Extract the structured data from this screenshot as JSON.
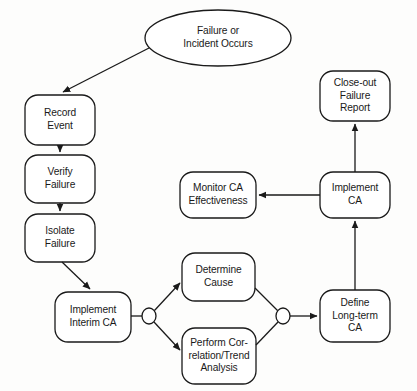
{
  "diagram": {
    "type": "flowchart",
    "stroke_color": "#1a1a1a",
    "fill_color": "#ffffff",
    "background_color": "#fdfdfc",
    "nodes": [
      {
        "id": "failure-or-incident-occurs",
        "label": "Failure or\nIncident Occurs",
        "shape": "ellipse",
        "x": 145,
        "y": 10,
        "w": 146,
        "h": 56
      },
      {
        "id": "record-event",
        "label": "Record\nEvent",
        "shape": "rounded-rect",
        "x": 25,
        "y": 95,
        "w": 70,
        "h": 50
      },
      {
        "id": "verify-failure",
        "label": "Verify\nFailure",
        "shape": "rounded-rect",
        "x": 25,
        "y": 155,
        "w": 70,
        "h": 48
      },
      {
        "id": "isolate-failure",
        "label": "Isolate\nFailure",
        "shape": "rounded-rect",
        "x": 25,
        "y": 214,
        "w": 70,
        "h": 48
      },
      {
        "id": "implement-interim-ca",
        "label": "Implement\nInterim CA",
        "shape": "rounded-rect",
        "x": 55,
        "y": 292,
        "w": 76,
        "h": 50
      },
      {
        "id": "determine-cause",
        "label": "Determine\nCause",
        "shape": "rounded-rect",
        "x": 182,
        "y": 253,
        "w": 73,
        "h": 48
      },
      {
        "id": "perform-correlation-trend-analysis",
        "label": "Perform Cor-\nrelation/Trend\nAnalysis",
        "shape": "rounded-rect",
        "x": 182,
        "y": 328,
        "w": 74,
        "h": 56
      },
      {
        "id": "define-long-term-ca",
        "label": "Define\nLong-term\nCA",
        "shape": "rounded-rect",
        "x": 320,
        "y": 290,
        "w": 70,
        "h": 52,
        "first_line_bold": true
      },
      {
        "id": "monitor-ca-effectiveness",
        "label": "Monitor CA\nEffectiveness",
        "shape": "rounded-rect",
        "x": 180,
        "y": 172,
        "w": 76,
        "h": 46
      },
      {
        "id": "implement-ca",
        "label": "Implement\nCA",
        "shape": "rounded-rect",
        "x": 320,
        "y": 172,
        "w": 70,
        "h": 46
      },
      {
        "id": "close-out-failure-report",
        "label": "Close-out\nFailure\nReport",
        "shape": "rounded-rect",
        "x": 320,
        "y": 71,
        "w": 70,
        "h": 50
      }
    ],
    "junctions": [
      {
        "id": "split-junction",
        "cx": 149,
        "cy": 316,
        "rx": 7,
        "ry": 8
      },
      {
        "id": "merge-junction",
        "cx": 283,
        "cy": 316,
        "rx": 7,
        "ry": 8
      }
    ],
    "connectors": [
      {
        "id": "occurs-to-record-event",
        "from": "failure-or-incident-occurs",
        "to": "record-event",
        "arrow": true
      },
      {
        "id": "record-event-to-verify-failure",
        "from": "record-event",
        "to": "verify-failure",
        "arrow": true
      },
      {
        "id": "verify-failure-to-isolate-failure",
        "from": "verify-failure",
        "to": "isolate-failure",
        "arrow": true
      },
      {
        "id": "isolate-failure-to-implement-interim-ca",
        "from": "isolate-failure",
        "to": "implement-interim-ca",
        "arrow": true
      },
      {
        "id": "implement-interim-ca-to-split",
        "from": "implement-interim-ca",
        "to": "split-junction",
        "arrow": false
      },
      {
        "id": "split-to-determine-cause",
        "from": "split-junction",
        "to": "determine-cause",
        "arrow": true
      },
      {
        "id": "split-to-perform-correlation",
        "from": "split-junction",
        "to": "perform-correlation-trend-analysis",
        "arrow": true
      },
      {
        "id": "determine-cause-to-merge",
        "from": "determine-cause",
        "to": "merge-junction",
        "arrow": false
      },
      {
        "id": "perform-correlation-to-merge",
        "from": "perform-correlation-trend-analysis",
        "to": "merge-junction",
        "arrow": false
      },
      {
        "id": "merge-to-define-long-term-ca",
        "from": "merge-junction",
        "to": "define-long-term-ca",
        "arrow": true
      },
      {
        "id": "define-long-term-ca-to-implement-ca",
        "from": "define-long-term-ca",
        "to": "implement-ca",
        "arrow": true
      },
      {
        "id": "implement-ca-to-monitor-ca-effectiveness",
        "from": "implement-ca",
        "to": "monitor-ca-effectiveness",
        "arrow": true
      },
      {
        "id": "implement-ca-to-close-out-failure-report",
        "from": "implement-ca",
        "to": "close-out-failure-report",
        "arrow": true
      }
    ]
  }
}
